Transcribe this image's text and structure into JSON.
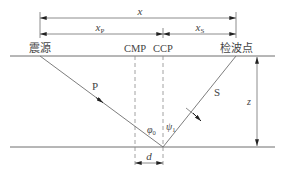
{
  "diagram": {
    "labels": {
      "x": "x",
      "xp_main": "x",
      "xp_sub": "P",
      "xs_main": "x",
      "xs_sub": "S",
      "source": "震源",
      "receiver": "检波点",
      "cmp": "CMP",
      "ccp": "CCP",
      "p_wave": "P",
      "s_wave": "S",
      "phi0_main": "φ",
      "phi0_sub": "0",
      "psi1_main": "ψ",
      "psi1_sub": "1",
      "z": "z",
      "d": "d"
    },
    "colors": {
      "line": "#6e6e6e",
      "dashed": "#8a8a8a",
      "text": "#444444",
      "background": "#ffffff"
    }
  }
}
